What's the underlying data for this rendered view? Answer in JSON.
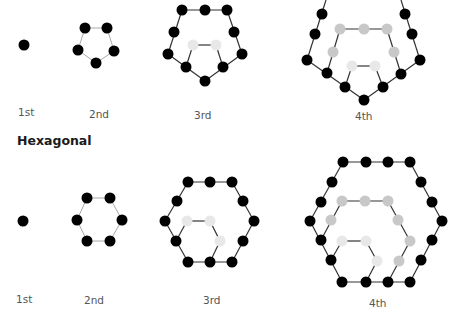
{
  "colors": {
    "black_dot": "#000000",
    "gray_dot": "#c8c8c8",
    "light_dot": "#e8e8e8",
    "edge": "#333333",
    "edge_light": "#aaaaaa"
  },
  "pentagonal": {
    "labels": [
      "1st",
      "2nd",
      "3rd",
      "4th"
    ],
    "figures": [
      {
        "name": "1st",
        "dots": [
          [
            24,
            45,
            "b"
          ]
        ],
        "edges": []
      },
      {
        "name": "2nd",
        "dots": [
          [
            85,
            28,
            "b"
          ],
          [
            107,
            28,
            "b"
          ],
          [
            78,
            50,
            "b"
          ],
          [
            114,
            51,
            "b"
          ],
          [
            96,
            63,
            "b"
          ]
        ],
        "edges": [
          [
            85,
            28,
            107,
            28,
            "l"
          ],
          [
            107,
            28,
            114,
            51,
            "l"
          ],
          [
            114,
            51,
            96,
            63,
            "l"
          ],
          [
            96,
            63,
            78,
            50,
            "l"
          ],
          [
            78,
            50,
            85,
            28,
            "l"
          ]
        ]
      },
      {
        "name": "3rd",
        "dots": [
          [
            182,
            10,
            "b"
          ],
          [
            205,
            10,
            "b"
          ],
          [
            227,
            10,
            "b"
          ],
          [
            174,
            32,
            "b"
          ],
          [
            234,
            32,
            "b"
          ],
          [
            168,
            54,
            "b"
          ],
          [
            242,
            54,
            "b"
          ],
          [
            186,
            67,
            "b"
          ],
          [
            223,
            67,
            "b"
          ],
          [
            205,
            81,
            "b"
          ],
          [
            193,
            45,
            "w"
          ],
          [
            216,
            45,
            "w"
          ]
        ],
        "edges": [
          [
            182,
            10,
            227,
            10,
            "d"
          ],
          [
            227,
            10,
            242,
            54,
            "d"
          ],
          [
            242,
            54,
            205,
            81,
            "d"
          ],
          [
            205,
            81,
            168,
            54,
            "d"
          ],
          [
            168,
            54,
            182,
            10,
            "d"
          ],
          [
            193,
            45,
            216,
            45,
            "d"
          ],
          [
            216,
            45,
            223,
            67,
            "d"
          ],
          [
            193,
            45,
            186,
            67,
            "d"
          ]
        ]
      },
      {
        "name": "4th",
        "dots": [
          [
            322,
            14,
            "b"
          ],
          [
            315,
            34,
            "b"
          ],
          [
            307,
            60,
            "b"
          ],
          [
            405,
            14,
            "b"
          ],
          [
            412,
            34,
            "b"
          ],
          [
            420,
            60,
            "b"
          ],
          [
            327,
            73,
            "b"
          ],
          [
            345,
            87,
            "b"
          ],
          [
            364,
            100,
            "b"
          ],
          [
            383,
            87,
            "b"
          ],
          [
            401,
            74,
            "b"
          ],
          [
            340,
            29,
            "g"
          ],
          [
            364,
            29,
            "g"
          ],
          [
            387,
            29,
            "g"
          ],
          [
            333,
            52,
            "g"
          ],
          [
            394,
            52,
            "g"
          ],
          [
            352,
            66,
            "w"
          ],
          [
            375,
            66,
            "w"
          ]
        ],
        "edges": [
          [
            326,
            0,
            307,
            60,
            "d"
          ],
          [
            401,
            0,
            420,
            60,
            "d"
          ],
          [
            307,
            60,
            364,
            100,
            "d"
          ],
          [
            420,
            60,
            364,
            100,
            "d"
          ],
          [
            340,
            29,
            387,
            29,
            "d"
          ],
          [
            340,
            29,
            327,
            73,
            "d"
          ],
          [
            387,
            29,
            401,
            74,
            "d"
          ],
          [
            352,
            66,
            375,
            66,
            "d"
          ],
          [
            352,
            66,
            345,
            87,
            "d"
          ],
          [
            375,
            66,
            383,
            87,
            "d"
          ]
        ]
      }
    ],
    "label_positions": [
      [
        18,
        106
      ],
      [
        89,
        108
      ],
      [
        194,
        109
      ],
      [
        355,
        110
      ]
    ]
  },
  "hexagonal": {
    "title": "Hexagonal",
    "labels": [
      "1st",
      "2nd",
      "3rd",
      "4th"
    ],
    "figures": [
      {
        "name": "1st",
        "dots": [
          [
            23,
            221,
            "b"
          ]
        ],
        "edges": []
      },
      {
        "name": "2nd",
        "dots": [
          [
            87,
            198,
            "b"
          ],
          [
            110,
            198,
            "b"
          ],
          [
            77,
            220,
            "b"
          ],
          [
            122,
            220,
            "b"
          ],
          [
            87,
            241,
            "b"
          ],
          [
            110,
            241,
            "b"
          ]
        ],
        "edges": [
          [
            87,
            198,
            110,
            198,
            "l"
          ],
          [
            110,
            198,
            122,
            220,
            "l"
          ],
          [
            122,
            220,
            110,
            241,
            "l"
          ],
          [
            110,
            241,
            87,
            241,
            "l"
          ],
          [
            87,
            241,
            77,
            220,
            "l"
          ],
          [
            77,
            220,
            87,
            198,
            "l"
          ]
        ]
      },
      {
        "name": "3rd",
        "dots": [
          [
            188,
            182,
            "b"
          ],
          [
            210,
            182,
            "b"
          ],
          [
            232,
            182,
            "b"
          ],
          [
            177,
            201,
            "b"
          ],
          [
            243,
            201,
            "b"
          ],
          [
            165,
            221,
            "b"
          ],
          [
            254,
            221,
            "b"
          ],
          [
            176,
            241,
            "b"
          ],
          [
            243,
            241,
            "b"
          ],
          [
            188,
            262,
            "b"
          ],
          [
            210,
            262,
            "b"
          ],
          [
            232,
            262,
            "b"
          ],
          [
            187,
            221,
            "w"
          ],
          [
            210,
            221,
            "w"
          ],
          [
            220,
            241,
            "w"
          ]
        ],
        "edges": [
          [
            188,
            182,
            232,
            182,
            "d"
          ],
          [
            232,
            182,
            254,
            221,
            "d"
          ],
          [
            254,
            221,
            232,
            262,
            "d"
          ],
          [
            232,
            262,
            188,
            262,
            "d"
          ],
          [
            188,
            262,
            165,
            221,
            "d"
          ],
          [
            165,
            221,
            188,
            182,
            "d"
          ],
          [
            187,
            221,
            210,
            221,
            "d"
          ],
          [
            210,
            221,
            220,
            241,
            "d"
          ],
          [
            187,
            221,
            176,
            241,
            "d"
          ],
          [
            220,
            241,
            210,
            262,
            "d"
          ]
        ]
      },
      {
        "name": "4th",
        "dots": [
          [
            343,
            162,
            "b"
          ],
          [
            366,
            162,
            "b"
          ],
          [
            388,
            162,
            "b"
          ],
          [
            410,
            162,
            "b"
          ],
          [
            332,
            182,
            "b"
          ],
          [
            321,
            202,
            "b"
          ],
          [
            310,
            221,
            "b"
          ],
          [
            321,
            240,
            "b"
          ],
          [
            331,
            260,
            "b"
          ],
          [
            421,
            182,
            "b"
          ],
          [
            432,
            202,
            "b"
          ],
          [
            442,
            221,
            "b"
          ],
          [
            432,
            240,
            "b"
          ],
          [
            421,
            260,
            "b"
          ],
          [
            342,
            282,
            "b"
          ],
          [
            366,
            282,
            "b"
          ],
          [
            388,
            282,
            "b"
          ],
          [
            410,
            282,
            "b"
          ],
          [
            342,
            201,
            "g"
          ],
          [
            365,
            201,
            "g"
          ],
          [
            388,
            201,
            "g"
          ],
          [
            331,
            220,
            "g"
          ],
          [
            398,
            220,
            "g"
          ],
          [
            410,
            241,
            "g"
          ],
          [
            399,
            261,
            "g"
          ],
          [
            342,
            241,
            "w"
          ],
          [
            366,
            241,
            "w"
          ],
          [
            377,
            261,
            "w"
          ]
        ],
        "edges": [
          [
            343,
            162,
            410,
            162,
            "d"
          ],
          [
            410,
            162,
            442,
            221,
            "d"
          ],
          [
            442,
            221,
            410,
            282,
            "d"
          ],
          [
            410,
            282,
            342,
            282,
            "d"
          ],
          [
            342,
            282,
            310,
            221,
            "d"
          ],
          [
            310,
            221,
            343,
            162,
            "d"
          ],
          [
            342,
            201,
            388,
            201,
            "d"
          ],
          [
            388,
            201,
            410,
            241,
            "d"
          ],
          [
            410,
            241,
            388,
            282,
            "d"
          ],
          [
            342,
            201,
            321,
            240,
            "d"
          ],
          [
            342,
            241,
            366,
            241,
            "d"
          ],
          [
            366,
            241,
            377,
            261,
            "d"
          ],
          [
            377,
            261,
            366,
            282,
            "d"
          ],
          [
            342,
            241,
            331,
            260,
            "d"
          ]
        ]
      }
    ],
    "title_position": [
      17,
      133
    ],
    "label_positions": [
      [
        16,
        293
      ],
      [
        84,
        294
      ],
      [
        203,
        294
      ],
      [
        369,
        297
      ]
    ]
  }
}
